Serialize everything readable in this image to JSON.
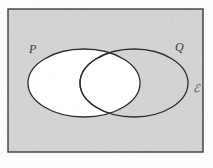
{
  "figure": {
    "kind": "venn-diagram",
    "caption_label": "Venn diagram of two overlapping sets P and Q inside universal set E",
    "width": 213,
    "height": 168
  },
  "colors": {
    "page_background": "#fdfdfd",
    "universe_fill": "#d3d3d3",
    "universe_stroke": "#3d3d3d",
    "set_fill_shaded": "#ffffff",
    "set_fill_unshaded": "none",
    "curve_stroke": "#2e2e2e",
    "label_color": "#3a3a3a"
  },
  "universe": {
    "name": "universal-set",
    "label": "ℰ",
    "label_x": 196,
    "label_y": 92,
    "rect": {
      "x": 8,
      "y": 9,
      "width": 195,
      "height": 143
    },
    "fill": "#d3d3d3",
    "stroke_width": 1.4
  },
  "sets": [
    {
      "id": "P",
      "name": "set-p",
      "label": "P",
      "label_x": 29,
      "label_y": 53,
      "shaded": true,
      "ellipse": {
        "cx": 84,
        "cy": 83,
        "rx": 56,
        "ry": 34
      }
    },
    {
      "id": "Q",
      "name": "set-q",
      "label": "Q",
      "label_x": 175,
      "label_y": 51,
      "shaded": false,
      "ellipse": {
        "cx": 134,
        "cy": 83,
        "rx": 54,
        "ry": 34
      }
    }
  ],
  "regions": {
    "p_only": {
      "name": "region-p-only",
      "fill": "#ffffff",
      "description": "P only"
    },
    "intersection": {
      "name": "region-p-and-q",
      "fill": "#ffffff",
      "description": "P intersect Q"
    },
    "q_only": {
      "name": "region-q-only",
      "fill": "#d3d3d3",
      "description": "Q only"
    },
    "outside": {
      "name": "region-outside",
      "fill": "#d3d3d3",
      "description": "Complement of P union Q"
    }
  },
  "intersection_points": [
    {
      "name": "upper-crossing",
      "x": 110,
      "y": 53
    },
    {
      "name": "lower-crossing",
      "x": 110,
      "y": 113
    }
  ],
  "stroke_widths": {
    "curve": 1.3,
    "rect": 1.4
  }
}
